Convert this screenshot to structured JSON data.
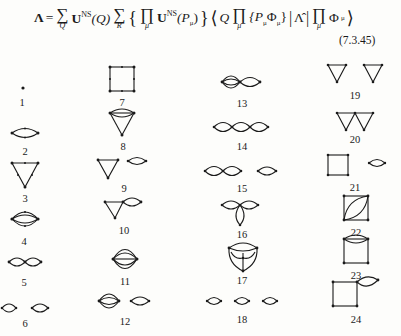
{
  "equation": {
    "lhs": "Λ",
    "equals": "=",
    "sum1": {
      "op": "∑",
      "index": "Q"
    },
    "term1": {
      "U": "U",
      "sup": "NS",
      "arg": "(Q)"
    },
    "sum2": {
      "op": "∑",
      "index": "R"
    },
    "brace_open": "{",
    "prod1": {
      "op": "∏",
      "index": "μ"
    },
    "term2": {
      "U": "U",
      "sup": "NS",
      "arg_open": "(P",
      "arg_sub": "μ",
      "arg_close": ")"
    },
    "brace_close": "}",
    "bra_open": "⟨",
    "bra_Q": "Q",
    "prod2": {
      "op": "∏",
      "index": "μ"
    },
    "bra_content": "{P",
    "bra_sub1": "μ",
    "bra_phi": "Φ",
    "bra_sub2": "μ",
    "bra_close_brace": "}",
    "bar1": "|",
    "operator": "Λ̂",
    "bar2": "|",
    "prod3": {
      "op": "∏",
      "index": "μ"
    },
    "ket_phi": "Φ",
    "ket_sub": "μ",
    "ket_close": "⟩",
    "number": "(7.3.45)"
  },
  "diagrams": [
    {
      "label": "1",
      "x": 22,
      "y": 97
    },
    {
      "label": "2",
      "x": 25,
      "y": 146
    },
    {
      "label": "3",
      "x": 25,
      "y": 193
    },
    {
      "label": "4",
      "x": 24,
      "y": 236
    },
    {
      "label": "5",
      "x": 24,
      "y": 277
    },
    {
      "label": "6",
      "x": 25,
      "y": 318
    },
    {
      "label": "7",
      "x": 122,
      "y": 97
    },
    {
      "label": "8",
      "x": 123,
      "y": 141
    },
    {
      "label": "9",
      "x": 124,
      "y": 183
    },
    {
      "label": "10",
      "x": 124,
      "y": 225
    },
    {
      "label": "11",
      "x": 125,
      "y": 276
    },
    {
      "label": "12",
      "x": 125,
      "y": 316
    },
    {
      "label": "13",
      "x": 242,
      "y": 98
    },
    {
      "label": "14",
      "x": 242,
      "y": 141
    },
    {
      "label": "15",
      "x": 242,
      "y": 183
    },
    {
      "label": "16",
      "x": 242,
      "y": 229
    },
    {
      "label": "17",
      "x": 242,
      "y": 275
    },
    {
      "label": "18",
      "x": 242,
      "y": 314
    },
    {
      "label": "19",
      "x": 355,
      "y": 90
    },
    {
      "label": "20",
      "x": 355,
      "y": 134
    },
    {
      "label": "21",
      "x": 355,
      "y": 182
    },
    {
      "label": "22",
      "x": 356,
      "y": 227
    },
    {
      "label": "23",
      "x": 356,
      "y": 270
    },
    {
      "label": "24",
      "x": 356,
      "y": 314
    }
  ]
}
